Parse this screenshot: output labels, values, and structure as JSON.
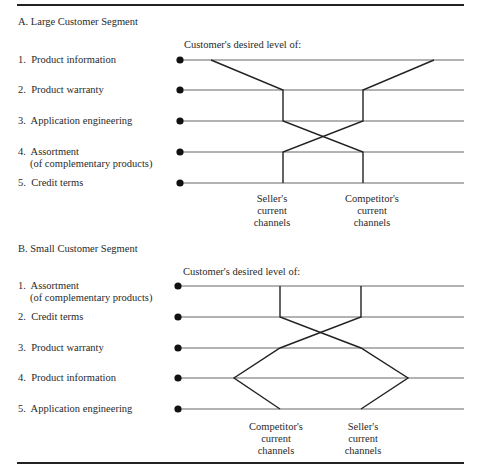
{
  "figure": {
    "section_a": {
      "title": "A.  Large Customer Segment",
      "axis_caption": "Customer's desired level of:",
      "rows": [
        {
          "num": "1.",
          "label": "Product information",
          "sub": ""
        },
        {
          "num": "2.",
          "label": "Product warranty",
          "sub": ""
        },
        {
          "num": "3.",
          "label": "Application engineering",
          "sub": ""
        },
        {
          "num": "4.",
          "label": "Assortment",
          "sub": "(of complementary products)"
        },
        {
          "num": "5.",
          "label": "Credit terms",
          "sub": ""
        }
      ],
      "channel_labels": [
        {
          "line1": "Seller's",
          "line2": "current",
          "line3": "channels"
        },
        {
          "line1": "Competitor's",
          "line2": "current",
          "line3": "channels"
        }
      ]
    },
    "section_b": {
      "title": "B.  Small Customer Segment",
      "axis_caption": "Customer's desired level of:",
      "rows": [
        {
          "num": "1.",
          "label": "Assortment",
          "sub": "(of complementary products)"
        },
        {
          "num": "2.",
          "label": "Credit terms",
          "sub": ""
        },
        {
          "num": "3.",
          "label": "Product warranty",
          "sub": ""
        },
        {
          "num": "4.",
          "label": "Product information",
          "sub": ""
        },
        {
          "num": "5.",
          "label": "Application engineering",
          "sub": ""
        }
      ],
      "channel_labels": [
        {
          "line1": "Competitor's",
          "line2": "current",
          "line3": "channels"
        },
        {
          "line1": "Seller's",
          "line2": "current",
          "line3": "channels"
        }
      ]
    }
  },
  "profiles": {
    "section_a": {
      "series": [
        {
          "name": "Seller's current channels",
          "x_by_row": [
            211,
            283,
            283,
            363,
            363
          ]
        },
        {
          "name": "Competitor's current channels",
          "x_by_row": [
            434,
            363,
            363,
            283,
            283
          ]
        }
      ]
    },
    "section_b": {
      "series": [
        {
          "name": "Seller's current channels",
          "x_by_row": [
            361,
            361,
            280,
            234,
            280
          ]
        },
        {
          "name": "Competitor's current channels",
          "x_by_row": [
            280,
            280,
            361,
            408,
            361
          ]
        }
      ]
    }
  },
  "colors": {
    "line": "#222222",
    "rule": "#222222",
    "grid": "#666666"
  }
}
